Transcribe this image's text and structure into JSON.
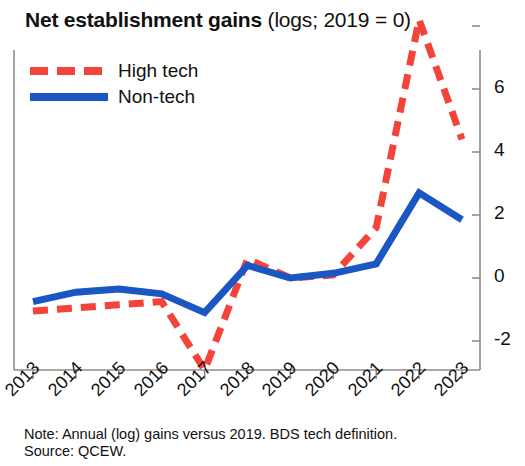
{
  "title": {
    "bold": "Net establishment gains",
    "regular": "(logs; 2019 = 0)"
  },
  "legend": [
    {
      "label": "High tech",
      "color": "#f4443a",
      "style": "dashed"
    },
    {
      "label": "Non-tech",
      "color": "#1a56c4",
      "style": "solid"
    }
  ],
  "footnote": {
    "note": "Note: Annual (log) gains versus 2019. BDS tech definition.",
    "source": "Source: QCEW."
  },
  "chart_data": {
    "type": "line",
    "title": "Net establishment gains (logs; 2019 = 0)",
    "xlabel": "",
    "ylabel": "",
    "categories": [
      "2013",
      "2014",
      "2015",
      "2016",
      "2017",
      "2018",
      "2019",
      "2020",
      "2021",
      "2022",
      "2023"
    ],
    "ylim": [
      -3,
      8.6
    ],
    "yticks": [
      -2,
      0,
      2,
      4,
      6
    ],
    "ytick_labels": [
      "-2",
      "0",
      "2",
      "4",
      "6"
    ],
    "grid": false,
    "legend_position": "top-left",
    "axis_side": "right",
    "series": [
      {
        "name": "High tech",
        "color": "#f4443a",
        "style": "dashed",
        "values": [
          -1.05,
          -0.95,
          -0.85,
          -0.75,
          -2.95,
          0.6,
          0.0,
          0.1,
          1.6,
          8.2,
          4.4
        ]
      },
      {
        "name": "Non-tech",
        "color": "#1a56c4",
        "style": "solid",
        "values": [
          -0.75,
          -0.45,
          -0.35,
          -0.5,
          -1.1,
          0.4,
          0.0,
          0.15,
          0.45,
          2.7,
          1.85
        ]
      }
    ]
  }
}
